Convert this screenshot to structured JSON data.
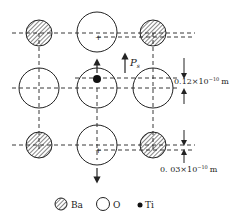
{
  "diagram": {
    "labels": {
      "polarization": "P",
      "polarization_sub": "s",
      "ti_shift": "0.12×10",
      "ti_shift_exp": "−10",
      "ti_shift_unit": "m",
      "o_shift": "0. 03×10",
      "o_shift_exp": "−10",
      "o_shift_unit": "m"
    },
    "legend": [
      {
        "symbol": "hatched-circle",
        "label": "Ba"
      },
      {
        "symbol": "open-circle",
        "label": "O"
      },
      {
        "symbol": "filled-dot",
        "label": "Ti"
      }
    ],
    "colors": {
      "stroke": "#222222",
      "background": "#ffffff"
    }
  }
}
